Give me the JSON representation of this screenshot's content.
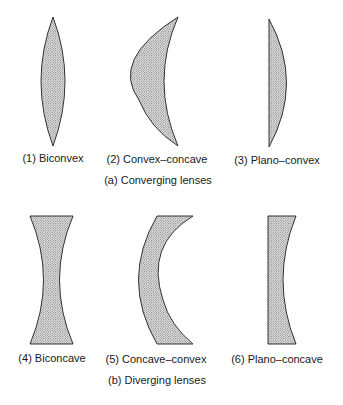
{
  "figure": {
    "group_a": {
      "caption": "(a) Converging lenses",
      "lenses": [
        {
          "id": 1,
          "label": "(1) Biconvex"
        },
        {
          "id": 2,
          "label": "(2) Convex–concave"
        },
        {
          "id": 3,
          "label": "(3) Plano–convex"
        }
      ]
    },
    "group_b": {
      "caption": "(b) Diverging lenses",
      "lenses": [
        {
          "id": 4,
          "label": "(4) Biconcave"
        },
        {
          "id": 5,
          "label": "(5) Concave–convex"
        },
        {
          "id": 6,
          "label": "(6) Plano–concave"
        }
      ]
    },
    "colors": {
      "outline": "#333333",
      "fill_dot": "#555555",
      "fill_bg": "#f2f2f2",
      "background": "#ffffff"
    }
  }
}
